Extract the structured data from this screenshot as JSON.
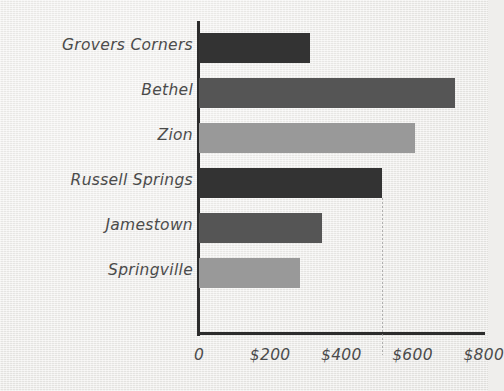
{
  "chart_data": {
    "type": "bar",
    "orientation": "horizontal",
    "title": "",
    "xlabel": "",
    "ylabel": "",
    "categories": [
      "Grovers Corners",
      "Bethel",
      "Zion",
      "Russell Springs",
      "Jamestown",
      "Springville"
    ],
    "values": [
      312,
      720,
      608,
      515,
      346,
      284
    ],
    "value_prefix": "$",
    "xlim": [
      0,
      812
    ],
    "xticks": [
      0,
      200,
      400,
      600,
      800
    ],
    "xtick_labels": [
      "0",
      "$200",
      "$400",
      "$600",
      "$800"
    ],
    "grid": false,
    "legend": false,
    "bar_colors": [
      "#333333",
      "#555555",
      "#999999",
      "#333333",
      "#555555",
      "#999999"
    ],
    "annotations": [
      {
        "name": "reference-line",
        "kind": "dotted-vertical",
        "at_value": 515,
        "color": "#9a9a9a"
      }
    ],
    "axis_color": "#2c2c2c",
    "label_color": "#4b4b4b",
    "background_color": "#eeedeb"
  }
}
